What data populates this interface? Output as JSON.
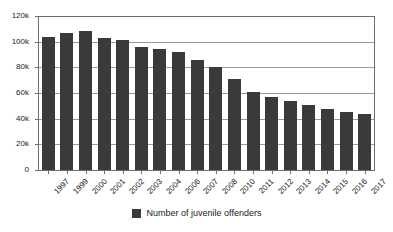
{
  "chart_data": {
    "type": "bar",
    "title": "",
    "subtitle": "",
    "xlabel": "",
    "ylabel": "",
    "categories": [
      "1997",
      "1999",
      "2000",
      "2001",
      "2002",
      "2003",
      "2004",
      "2006",
      "2007",
      "2008",
      "2010",
      "2011",
      "2012",
      "2013",
      "2014",
      "2015",
      "2016",
      "2017"
    ],
    "series": [
      {
        "name": "Number of juvenile offenders",
        "color": "#3a3a3a",
        "values": [
          104000,
          107000,
          108000,
          103000,
          101000,
          96000,
          94000,
          92000,
          86000,
          80000,
          71000,
          61000,
          57000,
          54000,
          51000,
          47500,
          45000,
          43500
        ]
      }
    ],
    "ylim": [
      0,
      120000
    ],
    "y_ticks": [
      0,
      20000,
      40000,
      60000,
      80000,
      100000,
      120000
    ],
    "y_tick_labels": [
      "0",
      "20k",
      "40k",
      "60k",
      "80k",
      "100k",
      "120k"
    ],
    "grid": true,
    "grid_axis": "y",
    "legend_position": "bottom",
    "x_tick_label_rotation": -45
  },
  "legend": {
    "entries": [
      {
        "label": "Number of juvenile offenders",
        "swatch_color": "#3a3a3a"
      }
    ]
  },
  "colors": {
    "bar": "#3a3a3a",
    "gridline": "#9a9a9a",
    "axis": "#6e6e6e",
    "text": "#1a1a1a",
    "background": "#ffffff"
  }
}
